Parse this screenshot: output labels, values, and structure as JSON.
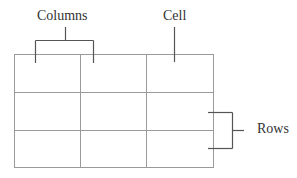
{
  "diagram": {
    "labels": {
      "columns": "Columns",
      "cell": "Cell",
      "rows": "Rows"
    },
    "grid": {
      "rows": 3,
      "columns": 3,
      "line_color": "#9a9a9a"
    },
    "annotation_line_color": "#555555",
    "text_color": "#333333"
  }
}
